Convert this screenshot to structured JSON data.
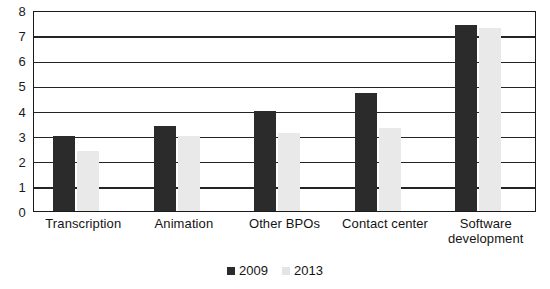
{
  "chart_data": {
    "type": "bar",
    "title": "",
    "subtitle": "",
    "xlabel": "",
    "ylabel": "",
    "ylim": [
      0,
      8
    ],
    "yticks": [
      "0",
      "1",
      "2",
      "3",
      "4",
      "5",
      "6",
      "7",
      "8"
    ],
    "grid": true,
    "legend_position": "bottom",
    "categories": [
      "Transcription",
      "Animation",
      "Other BPOs",
      "Contact center",
      "Software development"
    ],
    "category_lines": [
      [
        "Transcription"
      ],
      [
        "Animation"
      ],
      [
        "Other BPOs"
      ],
      [
        "Contact center"
      ],
      [
        "Software",
        "development"
      ]
    ],
    "series": [
      {
        "name": "2009",
        "color": "#2b2b2b",
        "values": [
          3.0,
          3.4,
          4.0,
          4.7,
          7.4
        ]
      },
      {
        "name": "2013",
        "color": "#e9e9e9",
        "values": [
          2.4,
          3.0,
          3.1,
          3.3,
          7.3
        ]
      }
    ]
  },
  "legend": {
    "items": [
      {
        "label": "2009",
        "swatch": "dark-square-marker"
      },
      {
        "label": "2013",
        "swatch": "light-square-marker"
      }
    ]
  },
  "colors": {
    "series_2009": "#2b2b2b",
    "series_2013": "#e9e9e9",
    "axis": "#1a1a1a",
    "gridline": "#242424",
    "background": "#ffffff"
  }
}
